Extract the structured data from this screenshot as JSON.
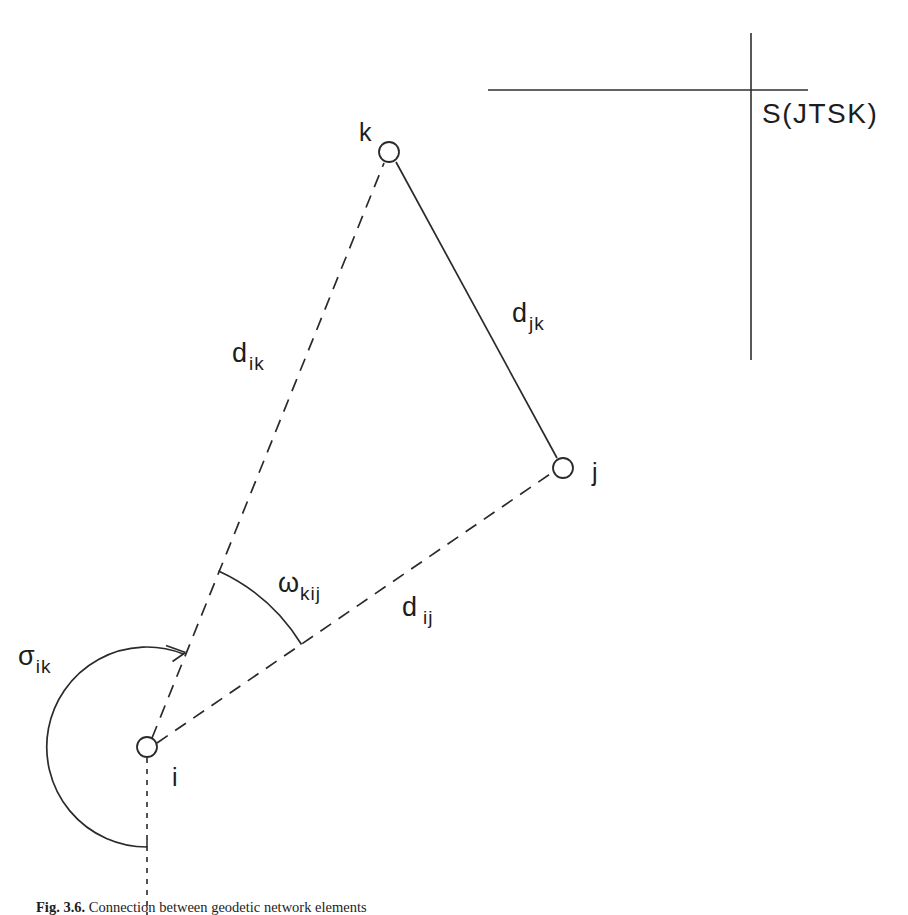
{
  "figure": {
    "domain": "geodetic-network-diagram",
    "background_color": "#ffffff",
    "ink_color": "#2a2a2a",
    "text_color": "#1d1d1d",
    "width": 908,
    "height": 915
  },
  "axis_system": {
    "name": "S(JTSK)",
    "label": "S(JTSK)",
    "vertical_axis": {
      "x": 751,
      "y1": 33,
      "y2": 360
    },
    "horizontal_axis": {
      "y": 90,
      "x1": 488,
      "x2": 808
    },
    "label_position": {
      "x": 762,
      "y": 100
    }
  },
  "points": [
    {
      "id": "k",
      "label": "k",
      "cx": 389,
      "cy": 152,
      "r": 10,
      "label_x": 359,
      "label_y": 120
    },
    {
      "id": "j",
      "label": "j",
      "cx": 563,
      "cy": 468,
      "r": 10,
      "label_x": 592,
      "label_y": 460
    },
    {
      "id": "i",
      "label": "i",
      "cx": 147,
      "cy": 747,
      "r": 10,
      "label_x": 172,
      "label_y": 765
    }
  ],
  "edges": [
    {
      "id": "d_ik",
      "from": "i",
      "to": "k",
      "style": "dashed",
      "label": "d",
      "subscript": "ik",
      "label_x": 232,
      "label_y": 340
    },
    {
      "id": "d_jk",
      "from": "j",
      "to": "k",
      "style": "solid",
      "label": "d",
      "subscript": "jk",
      "label_x": 512,
      "label_y": 300
    },
    {
      "id": "d_ij",
      "from": "i",
      "to": "j",
      "style": "dashed",
      "label": "d",
      "subscript": "ij",
      "label_x": 402,
      "label_y": 594
    }
  ],
  "reference_line": {
    "id": "meridian-down",
    "style": "dotted",
    "x": 147,
    "y1": 758,
    "y2": 915
  },
  "angles": [
    {
      "id": "omega_kij",
      "symbol": "ω",
      "subscript": "kij",
      "vertex": "i",
      "from_ray": "d_ik",
      "to_ray": "d_ij",
      "arc_radius": 190,
      "label_x": 278,
      "label_y": 570
    },
    {
      "id": "sigma_ik",
      "symbol": "σ",
      "subscript": "ik",
      "vertex": "i",
      "from_ray": "meridian-down",
      "to_ray": "d_ik",
      "arc_radius": 100,
      "arrow": true,
      "label_x": 18,
      "label_y": 643
    }
  ],
  "caption": {
    "number": "Fig. 3.6.",
    "text": "Connection between geodetic network elements"
  }
}
